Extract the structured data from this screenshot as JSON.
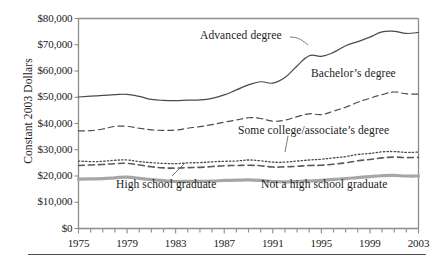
{
  "chart_data": {
    "type": "line",
    "title": "",
    "xlabel": "",
    "ylabel": "Constant 2003 Dollars",
    "xlim": [
      1975,
      2003
    ],
    "ylim": [
      0,
      80000
    ],
    "grid": false,
    "legend_position": "inline-annotations",
    "x": [
      1975,
      1976,
      1977,
      1978,
      1979,
      1980,
      1981,
      1982,
      1983,
      1984,
      1985,
      1986,
      1987,
      1988,
      1989,
      1990,
      1991,
      1992,
      1993,
      1994,
      1995,
      1996,
      1997,
      1998,
      1999,
      2000,
      2001,
      2002,
      2003
    ],
    "x_tick_labels": [
      "1975",
      "1979",
      "1983",
      "1987",
      "1991",
      "1995",
      "1999",
      "2003"
    ],
    "x_tick_values": [
      1975,
      1979,
      1983,
      1987,
      1991,
      1995,
      1999,
      2003
    ],
    "y_tick_labels": [
      "$0",
      "$10,000",
      "$20,000",
      "$30,000",
      "$40,000",
      "$50,000",
      "$60,000",
      "$70,000",
      "$80,000"
    ],
    "y_tick_values": [
      0,
      10000,
      20000,
      30000,
      40000,
      50000,
      60000,
      70000,
      80000
    ],
    "series": [
      {
        "name": "Advanced degree",
        "style": "solid",
        "color": "#4a4a4a",
        "width": 1.2,
        "values": [
          50100,
          50400,
          50700,
          51000,
          51100,
          50300,
          49200,
          48800,
          48700,
          48900,
          49000,
          49600,
          50900,
          52800,
          54700,
          55900,
          55400,
          57500,
          61900,
          65800,
          65600,
          67100,
          69600,
          71200,
          72900,
          74900,
          75100,
          74300,
          74700
        ]
      },
      {
        "name": "Bachelor's degree",
        "style": "dashed",
        "color": "#4a4a4a",
        "width": 1.2,
        "values": [
          37200,
          37300,
          37900,
          38900,
          38900,
          38200,
          37600,
          37400,
          37500,
          38200,
          38800,
          39600,
          40500,
          41300,
          42200,
          41900,
          40900,
          41300,
          42600,
          43700,
          43400,
          44700,
          46200,
          48100,
          49600,
          51000,
          52000,
          51300,
          51200
        ]
      },
      {
        "name": "Some college/associate's degree",
        "style": "dotted",
        "color": "#4a4a4a",
        "width": 1.3,
        "values": [
          25700,
          25500,
          25600,
          26000,
          26100,
          25500,
          25100,
          24800,
          24700,
          25000,
          25100,
          25400,
          25600,
          25700,
          26100,
          25800,
          25300,
          25300,
          25700,
          26100,
          26400,
          26900,
          27400,
          28200,
          28600,
          29200,
          29300,
          29000,
          29100
        ]
      },
      {
        "name": "High school graduate",
        "style": "dashed",
        "color": "#5a5a5a",
        "width": 1.6,
        "values": [
          24000,
          24200,
          24400,
          24700,
          24800,
          24200,
          23500,
          23100,
          23000,
          23200,
          23300,
          23600,
          23900,
          24000,
          24100,
          23900,
          23400,
          23500,
          23700,
          24000,
          24100,
          24500,
          25000,
          25800,
          26300,
          26900,
          27200,
          27000,
          27100
        ]
      },
      {
        "name": "Not a high school graduate",
        "style": "solid",
        "color": "#a6a6a6",
        "width": 3.2,
        "values": [
          18800,
          18900,
          19000,
          19300,
          19600,
          19100,
          18600,
          18200,
          17900,
          18000,
          18000,
          18100,
          18300,
          18400,
          18500,
          18300,
          17900,
          17800,
          17900,
          18100,
          18300,
          18700,
          19000,
          19400,
          19800,
          20100,
          20200,
          20000,
          20000
        ]
      }
    ],
    "annotations": [
      {
        "text": "Advanced degree",
        "x_px": 200,
        "y_px": 30,
        "leader": true
      },
      {
        "text": "Bachelor's degree",
        "x_px": 311,
        "y_px": 68,
        "leader": false
      },
      {
        "text": "Some college/associate's degree",
        "x_px": 238,
        "y_px": 125,
        "leader": true
      },
      {
        "text": "High school graduate",
        "x_px": 116,
        "y_px": 179,
        "leader": true
      },
      {
        "text": "Not a high school graduate",
        "x_px": 261,
        "y_px": 179,
        "leader": false
      }
    ]
  },
  "axis": {
    "y_title": "Constant 2003 Dollars",
    "y_ticks": [
      "$80,000",
      "$70,000",
      "$60,000",
      "$50,000",
      "$40,000",
      "$30,000",
      "$20,000",
      "$10,000",
      "$0"
    ],
    "x_ticks": [
      "1975",
      "1979",
      "1983",
      "1987",
      "1991",
      "1995",
      "1999",
      "2003"
    ]
  },
  "annotations": {
    "advanced": "Advanced degree",
    "bachelors": "Bachelor’s degree",
    "some_college": "Some college/associate’s degree",
    "high_school": "High school graduate",
    "not_high_school": "Not a high school graduate"
  },
  "colors": {
    "axis": "#8c8c8c",
    "line_dark": "#4a4a4a",
    "line_gray": "#a6a6a6",
    "text": "#1a1a1a",
    "rule": "#4d4d4d"
  }
}
